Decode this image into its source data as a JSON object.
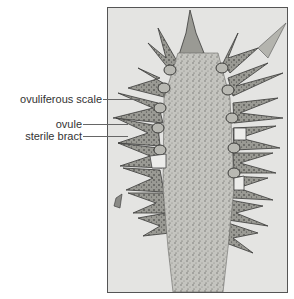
{
  "figure": {
    "labels": [
      {
        "id": "ovuliferous-scale",
        "text": "ovuliferous scale"
      },
      {
        "id": "ovule",
        "text": "ovule"
      },
      {
        "id": "sterile-bract",
        "text": "sterile bract"
      }
    ],
    "colors": {
      "background": "#e4e4e2",
      "tissue_dark": "#4a4a48",
      "tissue_mid": "#8a8a86",
      "tissue_light": "#c8c8c4",
      "ovule_fill": "#b0b0aa",
      "label_text": "#333333",
      "leader_line": "#666666"
    }
  }
}
